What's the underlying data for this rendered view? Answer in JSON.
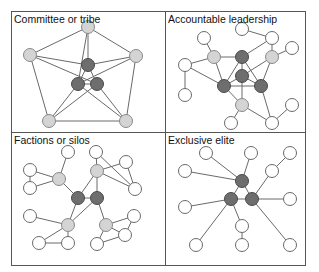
{
  "colors": {
    "core_fill": "#6e6e6e",
    "core_stroke": "#4a4a4a",
    "mid_fill": "#d4d4d4",
    "mid_stroke": "#8a8a8a",
    "outer_fill": "#ffffff",
    "outer_stroke": "#6a6a6a",
    "edge": "#6a6a6a",
    "frame": "#555555"
  },
  "panels": [
    {
      "title": "Committee or tribe",
      "nodes": [
        {
          "x": 88,
          "y": 27,
          "type": "mid"
        },
        {
          "x": 30,
          "y": 55,
          "type": "mid"
        },
        {
          "x": 136,
          "y": 56,
          "type": "mid"
        },
        {
          "x": 88,
          "y": 65,
          "type": "core"
        },
        {
          "x": 78,
          "y": 84,
          "type": "core"
        },
        {
          "x": 97,
          "y": 84,
          "type": "core"
        },
        {
          "x": 49,
          "y": 121,
          "type": "mid"
        },
        {
          "x": 126,
          "y": 121,
          "type": "mid"
        }
      ],
      "edges": [
        [
          0,
          1
        ],
        [
          0,
          2
        ],
        [
          0,
          3
        ],
        [
          0,
          4
        ],
        [
          1,
          3
        ],
        [
          1,
          5
        ],
        [
          1,
          6
        ],
        [
          2,
          3
        ],
        [
          2,
          4
        ],
        [
          2,
          7
        ],
        [
          3,
          4
        ],
        [
          3,
          5
        ],
        [
          4,
          5
        ],
        [
          4,
          6
        ],
        [
          4,
          7
        ],
        [
          5,
          6
        ],
        [
          5,
          7
        ],
        [
          6,
          7
        ]
      ]
    },
    {
      "title": "Accountable leadership",
      "nodes": [
        {
          "x": 242,
          "y": 29,
          "type": "outer"
        },
        {
          "x": 272,
          "y": 38,
          "type": "outer"
        },
        {
          "x": 204,
          "y": 38,
          "type": "outer"
        },
        {
          "x": 214,
          "y": 57,
          "type": "mid"
        },
        {
          "x": 242,
          "y": 57,
          "type": "core"
        },
        {
          "x": 272,
          "y": 57,
          "type": "mid"
        },
        {
          "x": 292,
          "y": 48,
          "type": "outer"
        },
        {
          "x": 185,
          "y": 65,
          "type": "outer"
        },
        {
          "x": 242,
          "y": 76,
          "type": "core"
        },
        {
          "x": 224,
          "y": 86,
          "type": "core"
        },
        {
          "x": 261,
          "y": 86,
          "type": "core"
        },
        {
          "x": 185,
          "y": 95,
          "type": "outer"
        },
        {
          "x": 242,
          "y": 105,
          "type": "mid"
        },
        {
          "x": 292,
          "y": 105,
          "type": "outer"
        },
        {
          "x": 231,
          "y": 123,
          "type": "outer"
        },
        {
          "x": 272,
          "y": 123,
          "type": "outer"
        }
      ],
      "edges": [
        [
          0,
          1
        ],
        [
          1,
          4
        ],
        [
          1,
          5
        ],
        [
          2,
          3
        ],
        [
          3,
          4
        ],
        [
          3,
          7
        ],
        [
          3,
          9
        ],
        [
          4,
          8
        ],
        [
          4,
          9
        ],
        [
          4,
          10
        ],
        [
          5,
          6
        ],
        [
          5,
          8
        ],
        [
          5,
          10
        ],
        [
          7,
          11
        ],
        [
          7,
          9
        ],
        [
          8,
          9
        ],
        [
          8,
          10
        ],
        [
          9,
          10
        ],
        [
          8,
          12
        ],
        [
          9,
          12
        ],
        [
          10,
          15
        ],
        [
          12,
          14
        ],
        [
          12,
          15
        ],
        [
          13,
          15
        ]
      ]
    },
    {
      "title": "Factions or silos",
      "nodes": [
        {
          "x": 68,
          "y": 152,
          "type": "outer"
        },
        {
          "x": 96,
          "y": 152,
          "type": "outer"
        },
        {
          "x": 126,
          "y": 162,
          "type": "outer"
        },
        {
          "x": 30,
          "y": 170,
          "type": "outer"
        },
        {
          "x": 59,
          "y": 179,
          "type": "mid"
        },
        {
          "x": 97,
          "y": 171,
          "type": "mid"
        },
        {
          "x": 30,
          "y": 188,
          "type": "outer"
        },
        {
          "x": 135,
          "y": 189,
          "type": "outer"
        },
        {
          "x": 78,
          "y": 198,
          "type": "core"
        },
        {
          "x": 97,
          "y": 198,
          "type": "core"
        },
        {
          "x": 30,
          "y": 216,
          "type": "outer"
        },
        {
          "x": 134,
          "y": 216,
          "type": "outer"
        },
        {
          "x": 68,
          "y": 225,
          "type": "mid"
        },
        {
          "x": 106,
          "y": 225,
          "type": "mid"
        },
        {
          "x": 125,
          "y": 235,
          "type": "outer"
        },
        {
          "x": 39,
          "y": 243,
          "type": "outer"
        },
        {
          "x": 68,
          "y": 243,
          "type": "outer"
        },
        {
          "x": 97,
          "y": 244,
          "type": "outer"
        }
      ],
      "edges": [
        [
          0,
          4
        ],
        [
          1,
          5
        ],
        [
          1,
          7
        ],
        [
          2,
          5
        ],
        [
          2,
          7
        ],
        [
          3,
          4
        ],
        [
          3,
          6
        ],
        [
          4,
          6
        ],
        [
          4,
          8
        ],
        [
          5,
          7
        ],
        [
          5,
          8
        ],
        [
          5,
          9
        ],
        [
          8,
          9
        ],
        [
          8,
          12
        ],
        [
          9,
          12
        ],
        [
          9,
          13
        ],
        [
          10,
          12
        ],
        [
          11,
          13
        ],
        [
          11,
          14
        ],
        [
          12,
          15
        ],
        [
          12,
          16
        ],
        [
          13,
          14
        ],
        [
          13,
          17
        ],
        [
          14,
          17
        ],
        [
          15,
          16
        ]
      ]
    },
    {
      "title": "Exclusive elite",
      "nodes": [
        {
          "x": 206,
          "y": 153,
          "type": "outer"
        },
        {
          "x": 251,
          "y": 153,
          "type": "outer"
        },
        {
          "x": 290,
          "y": 153,
          "type": "outer"
        },
        {
          "x": 185,
          "y": 171,
          "type": "outer"
        },
        {
          "x": 272,
          "y": 171,
          "type": "outer"
        },
        {
          "x": 242,
          "y": 181,
          "type": "core"
        },
        {
          "x": 231,
          "y": 199,
          "type": "core"
        },
        {
          "x": 252,
          "y": 199,
          "type": "core"
        },
        {
          "x": 290,
          "y": 199,
          "type": "outer"
        },
        {
          "x": 185,
          "y": 207,
          "type": "outer"
        },
        {
          "x": 242,
          "y": 226,
          "type": "outer"
        },
        {
          "x": 196,
          "y": 245,
          "type": "outer"
        },
        {
          "x": 242,
          "y": 245,
          "type": "outer"
        },
        {
          "x": 290,
          "y": 245,
          "type": "outer"
        }
      ],
      "edges": [
        [
          0,
          5
        ],
        [
          1,
          5
        ],
        [
          3,
          5
        ],
        [
          2,
          4
        ],
        [
          4,
          7
        ],
        [
          5,
          6
        ],
        [
          5,
          7
        ],
        [
          6,
          7
        ],
        [
          6,
          9
        ],
        [
          6,
          10
        ],
        [
          6,
          11
        ],
        [
          7,
          8
        ],
        [
          7,
          13
        ],
        [
          10,
          12
        ]
      ]
    }
  ]
}
